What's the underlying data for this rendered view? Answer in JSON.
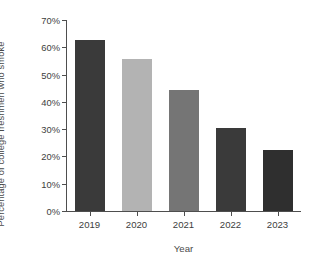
{
  "chart_data": {
    "type": "bar",
    "title": "",
    "subtitle": "",
    "xlabel": "Year",
    "ylabel": "Percentage of college freshmen who smoke",
    "categories": [
      "2019",
      "2020",
      "2021",
      "2022",
      "2023"
    ],
    "values": [
      62.5,
      55.7,
      44.5,
      30.3,
      22.2
    ],
    "bar_colors": [
      "#3a3a3a",
      "#b3b3b3",
      "#757575",
      "#3a3a3a",
      "#2f2f2f"
    ],
    "ylim": [
      0,
      70
    ],
    "ytick_values": [
      0,
      10,
      20,
      30,
      40,
      50,
      60,
      70
    ],
    "ytick_labels": [
      "0%",
      "10%",
      "20%",
      "30%",
      "40%",
      "50%",
      "60%",
      "70%"
    ],
    "grid": false,
    "legend": "none",
    "axis_color": "#4e4e4e",
    "background": "#ffffff"
  }
}
